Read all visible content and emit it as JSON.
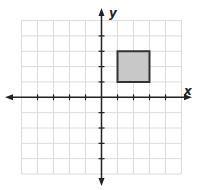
{
  "chart_data": {
    "type": "coordinate-grid",
    "title": "",
    "xlabel": "x",
    "ylabel": "y",
    "xlim": [
      -5,
      5
    ],
    "ylim": [
      -5,
      5
    ],
    "grid": true,
    "x_ticks": [
      -4,
      -3,
      -2,
      -1,
      1,
      2,
      3,
      4
    ],
    "y_ticks": [
      -4,
      -3,
      -2,
      -1,
      1,
      2,
      3,
      4
    ],
    "shapes": [
      {
        "type": "square",
        "vertices": [
          [
            1,
            1
          ],
          [
            3,
            1
          ],
          [
            3,
            3
          ],
          [
            1,
            3
          ]
        ],
        "fill": "#c8c8c8",
        "stroke": "#333333"
      }
    ]
  },
  "layout": {
    "origin_px": [
      101.5,
      97.3
    ],
    "unit_x_px": 16,
    "unit_y_px": 15.35,
    "colors": {
      "grid": "#dcdcdc",
      "axis": "#222222",
      "shape_fill": "#c8c8c8",
      "shape_stroke": "#333333"
    }
  },
  "labels": {
    "x_axis": "x",
    "y_axis": "y"
  }
}
